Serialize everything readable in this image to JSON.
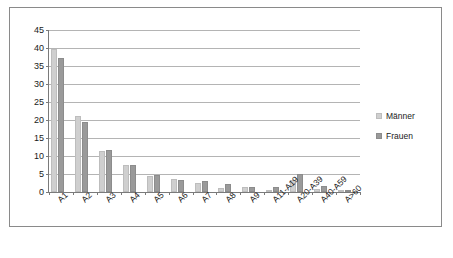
{
  "chart_data": {
    "type": "bar",
    "title": "",
    "xlabel": "",
    "ylabel": "",
    "ylim": [
      0,
      45
    ],
    "yticks": [
      0,
      5,
      10,
      15,
      20,
      25,
      30,
      35,
      40,
      45
    ],
    "grid": true,
    "legend_position": "right",
    "categories": [
      "A1",
      "A2",
      "A3",
      "A4",
      "A5",
      "A6",
      "A7",
      "A8",
      "A9",
      "A11-A19",
      "A20-A39",
      "A40-A59",
      "A>60"
    ],
    "series": [
      {
        "name": "Männer",
        "color": "#cfcfcf",
        "values": [
          39.7,
          21.2,
          11.4,
          7.5,
          4.4,
          3.7,
          2.4,
          1.2,
          1.3,
          0.6,
          3.2,
          0.9,
          0.1
        ]
      },
      {
        "name": "Frauen",
        "color": "#9a9a9a",
        "values": [
          37.1,
          19.4,
          11.6,
          7.6,
          4.7,
          3.4,
          3.1,
          2.1,
          1.3,
          1.3,
          4.9,
          1.7,
          0.15
        ]
      }
    ]
  },
  "legend": {
    "items": [
      {
        "label": "Männer",
        "swatch": "legend-swatch-mann"
      },
      {
        "label": "Frauen",
        "swatch": "legend-swatch-frau"
      }
    ]
  }
}
